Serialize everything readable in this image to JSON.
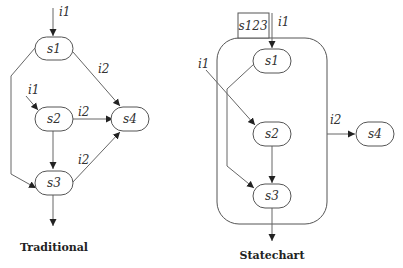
{
  "traditional": {
    "caption": "Traditional",
    "states": {
      "s1": "s1",
      "s2": "s2",
      "s3": "s3",
      "s4": "s4"
    },
    "labels": {
      "entry_s1": "i1",
      "entry_s2": "i1",
      "s1_s4": "i2",
      "s2_s4": "i2",
      "s3_s4": "i2"
    }
  },
  "statechart": {
    "caption": "Statechart",
    "superstate": "s123",
    "states": {
      "s1": "s1",
      "s2": "s2",
      "s3": "s3",
      "s4": "s4"
    },
    "labels": {
      "entry_s1": "i1",
      "entry_s2": "i1",
      "super_s4": "i2"
    }
  }
}
